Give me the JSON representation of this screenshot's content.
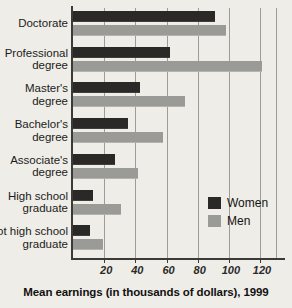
{
  "chart_data": {
    "type": "bar",
    "orientation": "horizontal",
    "title": "",
    "xlabel": "Mean earnings (in thousands of dollars), 1999",
    "ylabel": "",
    "xlim": [
      0,
      130
    ],
    "xticks": [
      20,
      40,
      60,
      80,
      100,
      120
    ],
    "grid": true,
    "legend_position": "inside-right",
    "categories": [
      "Doctorate",
      "Professional\ndegree",
      "Master's\ndegree",
      "Bachelor's\ndegree",
      "Associate's\ndegree",
      "High school\ngraduate",
      "Not high school\ngraduate"
    ],
    "series": [
      {
        "name": "Women",
        "color": "#2a2927",
        "values": [
          91,
          62,
          43,
          35,
          27,
          13,
          11
        ]
      },
      {
        "name": "Men",
        "color": "#9a9a96",
        "values": [
          98,
          121,
          72,
          58,
          42,
          31,
          19
        ]
      }
    ]
  },
  "legend": {
    "items": [
      {
        "label": "Women",
        "color": "#2a2927"
      },
      {
        "label": "Men",
        "color": "#9a9a96"
      }
    ]
  },
  "axis": {
    "x_title": "Mean earnings (in thousands of dollars), 1999",
    "tick_labels": [
      "20",
      "40",
      "60",
      "80",
      "100",
      "120"
    ]
  }
}
